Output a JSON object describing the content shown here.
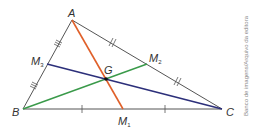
{
  "diagram": {
    "vertices": {
      "A": {
        "label": "A",
        "x": 72,
        "y": 20
      },
      "B": {
        "label": "B",
        "x": 23,
        "y": 109
      },
      "C": {
        "label": "C",
        "x": 222,
        "y": 109
      }
    },
    "midpoints": {
      "M1": {
        "label": "M",
        "sub": "1",
        "x": 123,
        "y": 109
      },
      "M2": {
        "label": "M",
        "sub": "2",
        "x": 147,
        "y": 64
      },
      "M3": {
        "label": "M",
        "sub": "3",
        "x": 47,
        "y": 64
      }
    },
    "centroid": {
      "label": "G",
      "x": 106,
      "y": 79
    },
    "medians": [
      {
        "name": "A-M1",
        "color": "#e0602a"
      },
      {
        "name": "B-M2",
        "color": "#3a9a4a"
      },
      {
        "name": "C-M3",
        "color": "#2c2f7a"
      }
    ],
    "side_color": "#555555",
    "credit": "Banco de imagens/Arquivo da editora"
  }
}
